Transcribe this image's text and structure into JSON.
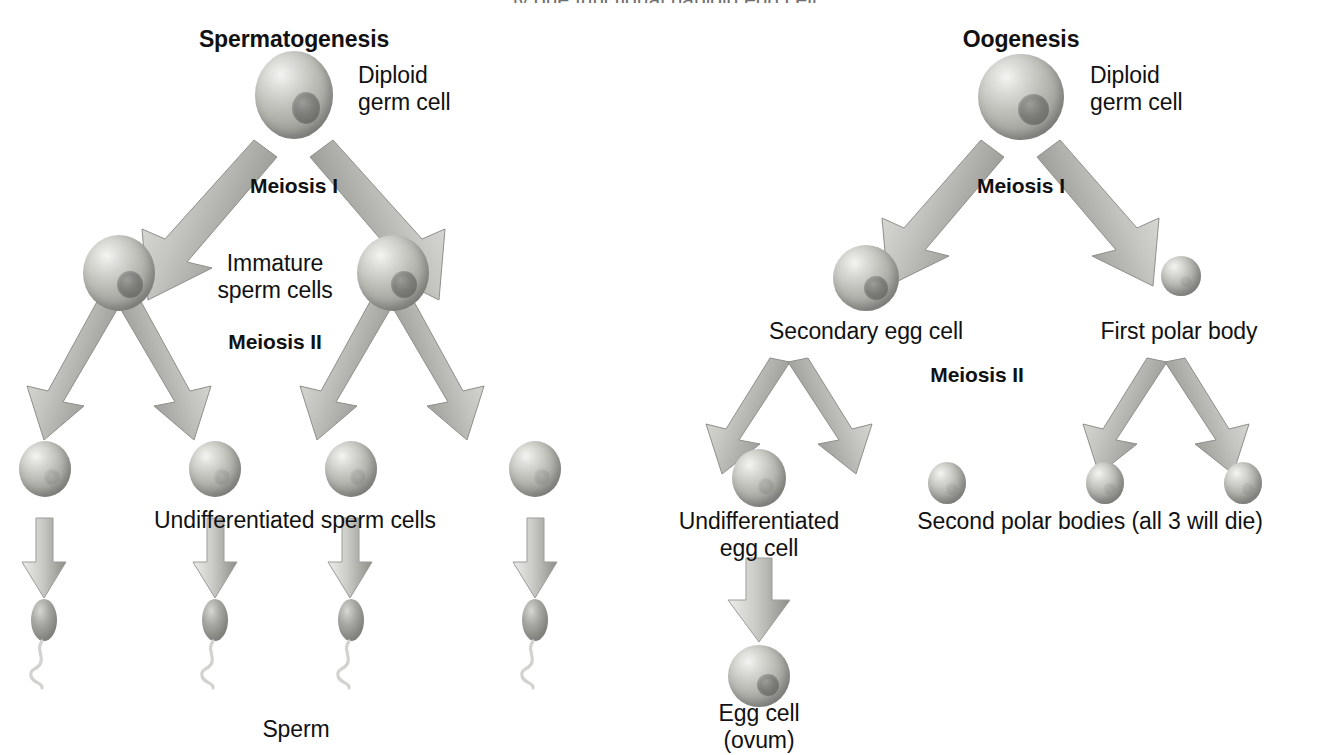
{
  "page": {
    "width": 1318,
    "height": 755,
    "background": "#ffffff",
    "cut_off_caption": "...ly one functional haploid egg cell."
  },
  "colors": {
    "text": "#111111",
    "cell_light": "#e6e6e2",
    "cell_mid": "#b5b5b0",
    "cell_dark": "#878784",
    "nucleus": "#7a7a77",
    "arrow_dark": "#8a8a86",
    "arrow_light": "#e8e8e6",
    "arrow_outline": "#9a9a96",
    "sperm_head": "#9a9a96",
    "sperm_tail": "#d9d9d6"
  },
  "spermatogenesis": {
    "title": "Spermatogenesis",
    "germ_cell_label": "Diploid\ngerm cell",
    "germ_cell_label_line1": "Diploid",
    "germ_cell_label_line2": "germ cell",
    "meiosis_i": "Meiosis I",
    "meiosis_ii": "Meiosis II",
    "immature_label_line1": "Immature",
    "immature_label_line2": "sperm cells",
    "undifferentiated_label": "Undifferentiated sperm cells",
    "product_label": "Sperm",
    "counts": {
      "germ_cells": 1,
      "immature_sperm_cells": 2,
      "undifferentiated_sperm_cells": 4,
      "sperm": 4
    }
  },
  "oogenesis": {
    "title": "Oogenesis",
    "germ_cell_label_line1": "Diploid",
    "germ_cell_label_line2": "germ cell",
    "meiosis_i": "Meiosis I",
    "meiosis_ii": "Meiosis II",
    "secondary_egg_label": "Secondary egg cell",
    "first_polar_body_label": "First polar body",
    "undifferentiated_egg_label_line1": "Undifferentiated",
    "undifferentiated_egg_label_line2": "egg cell",
    "second_polar_bodies_label": "Second polar bodies (all 3 will die)",
    "egg_cell_label_line1": "Egg cell",
    "egg_cell_label_line2": "(ovum)",
    "counts": {
      "germ_cells": 1,
      "secondary_egg_cells": 1,
      "first_polar_bodies": 1,
      "undifferentiated_egg_cells": 1,
      "second_polar_bodies": 3,
      "egg_cells": 1
    }
  }
}
